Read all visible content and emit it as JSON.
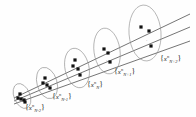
{
  "figure": {
    "kind": "geometric-diagram",
    "background_color": "#fefefe",
    "ink_color": "#2b2b2b",
    "ellipse_stroke": "#8a8a8a",
    "line_stroke": "#3a3a3a",
    "marker_color": "#111111",
    "clusters": [
      {
        "id": "cluster-n-minus-2",
        "label": {
          "open": "{",
          "var": "x",
          "sup": "n",
          "sub": "N-2",
          "close": "}"
        },
        "label_text": "{x n N-2}",
        "center": {
          "x": 22,
          "y": 96
        },
        "rx": 8,
        "ry": 13,
        "rotation": -22,
        "points": 3,
        "label_pos": {
          "x": 25,
          "y": 104
        }
      },
      {
        "id": "cluster-n-minus-1",
        "label": {
          "open": "{",
          "var": "x",
          "sup": "n",
          "sub": "N-1",
          "close": "}"
        },
        "label_text": "{x n N-1}",
        "center": {
          "x": 47,
          "y": 83
        },
        "rx": 10,
        "ry": 16,
        "rotation": -16,
        "points": 3,
        "label_pos": {
          "x": 52,
          "y": 93
        }
      },
      {
        "id": "cluster-n",
        "label": {
          "open": "{",
          "var": "x",
          "sup": "n",
          "sub": "N",
          "close": "}"
        },
        "label_text": "{x n N}",
        "center": {
          "x": 77,
          "y": 68
        },
        "rx": 12,
        "ry": 20,
        "rotation": -12,
        "points": 3,
        "label_pos": {
          "x": 87,
          "y": 81
        }
      },
      {
        "id": "cluster-n-plus-1",
        "label": {
          "open": "{",
          "var": "x",
          "sup": "n",
          "sub": "N+1",
          "close": "}"
        },
        "label_text": "{x n N+1}",
        "center": {
          "x": 107,
          "y": 51
        },
        "rx": 13,
        "ry": 23,
        "rotation": -8,
        "points": 3,
        "label_pos": {
          "x": 114,
          "y": 68
        }
      },
      {
        "id": "cluster-n-plus-2",
        "label": {
          "open": "{",
          "var": "x",
          "sup": "n",
          "sub": "N+2",
          "close": "}"
        },
        "label_text": "{x n N+2}",
        "center": {
          "x": 145,
          "y": 33
        },
        "rx": 16,
        "ry": 28,
        "rotation": -4,
        "points": 3,
        "label_pos": {
          "x": 160,
          "y": 55
        }
      }
    ],
    "lines": [
      {
        "id": "characteristic-line-upper",
        "from": {
          "x": 14,
          "y": 98
        },
        "to": {
          "x": 190,
          "y": 14
        }
      },
      {
        "id": "characteristic-line-middle",
        "from": {
          "x": 14,
          "y": 101
        },
        "to": {
          "x": 190,
          "y": 27
        }
      },
      {
        "id": "characteristic-line-lower",
        "from": {
          "x": 14,
          "y": 104
        },
        "to": {
          "x": 190,
          "y": 41
        }
      }
    ],
    "markers": [
      {
        "x": 18,
        "y": 98
      },
      {
        "x": 21,
        "y": 99
      },
      {
        "x": 24,
        "y": 100
      },
      {
        "x": 20,
        "y": 94
      },
      {
        "x": 25,
        "y": 102
      },
      {
        "x": 43,
        "y": 83
      },
      {
        "x": 47,
        "y": 85
      },
      {
        "x": 50,
        "y": 88
      },
      {
        "x": 45,
        "y": 78
      },
      {
        "x": 73,
        "y": 66
      },
      {
        "x": 78,
        "y": 69
      },
      {
        "x": 80,
        "y": 75
      },
      {
        "x": 75,
        "y": 60
      },
      {
        "x": 104,
        "y": 49
      },
      {
        "x": 108,
        "y": 53
      },
      {
        "x": 110,
        "y": 62
      },
      {
        "x": 141,
        "y": 27
      },
      {
        "x": 149,
        "y": 31
      },
      {
        "x": 151,
        "y": 46
      }
    ],
    "tick_notes": [
      {
        "id": "tick-note-a",
        "x": 106,
        "y": 58,
        "text": "·"
      },
      {
        "id": "tick-note-b",
        "x": 146,
        "y": 38,
        "text": "·"
      }
    ]
  }
}
